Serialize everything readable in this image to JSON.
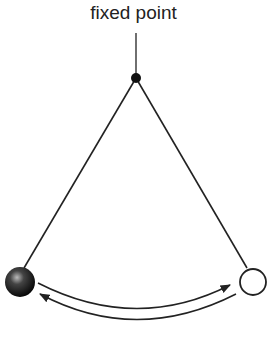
{
  "diagram": {
    "label": "fixed point",
    "elements": [
      "fixed-point",
      "string-left",
      "string-right",
      "bob-left (shaded)",
      "bob-right (outline)",
      "swing-arrows"
    ],
    "colors": {
      "line": "#222222",
      "bob_dark": "#111111",
      "background": "#ffffff"
    }
  }
}
